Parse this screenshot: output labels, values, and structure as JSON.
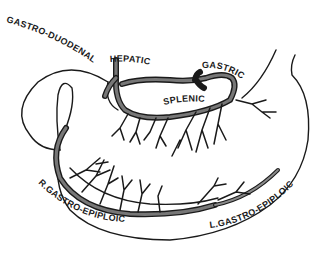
{
  "diagram": {
    "labels": {
      "gastro_duodenal": "GASTRO-DUODENAL",
      "hepatic": "HEPATIC",
      "gastric": "GASTRIC",
      "splenic": "SPLENIC",
      "r_gastro_epiploic": "R.GASTRO-EPIPLOIC",
      "l_gastro_epiploic": "L.GASTRO-EPIPLOIC"
    },
    "colors": {
      "ink": "#1a1a1a",
      "vessel_fill": "#777777",
      "background": "#ffffff"
    }
  }
}
